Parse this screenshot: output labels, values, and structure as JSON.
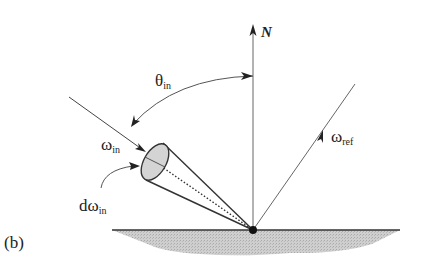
{
  "figure": {
    "panel_label": "(b)",
    "normal_label": "N",
    "theta_label": {
      "symbol": "θ",
      "subscript": "in"
    },
    "omega_in_label": {
      "symbol": "ω",
      "subscript": "in"
    },
    "d_omega_in_label": {
      "symbol": "dω",
      "subscript": "in"
    },
    "omega_ref_label": {
      "symbol": "ω",
      "subscript": "ref"
    }
  },
  "colors": {
    "line": "#555555",
    "dark_line": "#222222",
    "surface_fill": "#c8c8c8",
    "cone_fill": "#d0d0d0",
    "background": "#ffffff"
  }
}
